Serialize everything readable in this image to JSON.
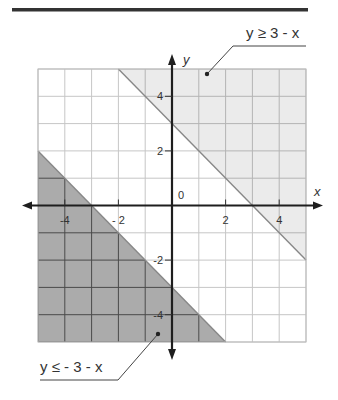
{
  "chart_data": {
    "type": "inequality-graph",
    "title": "",
    "xlabel": "x",
    "ylabel": "y",
    "xlim": [
      -5,
      5
    ],
    "ylim": [
      -5,
      5
    ],
    "grid": true,
    "x_ticks": [
      {
        "value": -4,
        "label": "-4"
      },
      {
        "value": -2,
        "label": "- 2"
      },
      {
        "value": 2,
        "label": "2"
      },
      {
        "value": 4,
        "label": "4"
      }
    ],
    "y_ticks": [
      {
        "value": 4,
        "label": "4"
      },
      {
        "value": 2,
        "label": "2"
      },
      {
        "value": -2,
        "label": "-2"
      },
      {
        "value": -4,
        "label": "-4"
      }
    ],
    "origin_label": "0",
    "series": [
      {
        "name": "y ≥ 3 - x",
        "boundary": {
          "slope": -1,
          "intercept": 3
        },
        "shade": "above",
        "polygon": [
          [
            -2,
            5
          ],
          [
            5,
            5
          ],
          [
            5,
            -2
          ]
        ],
        "fill": "#ebebeb",
        "gridline": "#b4b4b4"
      },
      {
        "name": "y ≤ - 3 - x",
        "boundary": {
          "slope": -1,
          "intercept": -3
        },
        "shade": "below",
        "polygon": [
          [
            -5,
            2
          ],
          [
            -5,
            -5
          ],
          [
            2,
            -5
          ]
        ],
        "fill": "#ababab",
        "gridline": "#4a4a4a"
      }
    ],
    "annotations": [
      {
        "text": "y ≥ 3 - x",
        "points_to": [
          0.7,
          4.9
        ]
      },
      {
        "text": "y ≤ - 3 - x",
        "points_to": [
          -0.5,
          -4.6
        ]
      }
    ]
  },
  "labels": {
    "upper": "y ≥ 3 - x",
    "lower": "y ≤ - 3 - x",
    "x_axis": "x",
    "y_axis": "y",
    "origin": "0"
  },
  "colors": {
    "rule": "#333333",
    "axis": "#1e1e1e",
    "grid": "#c6c6c6",
    "boundary": "#888888"
  }
}
